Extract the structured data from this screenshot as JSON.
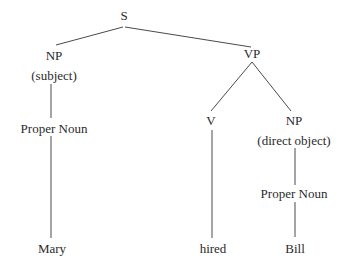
{
  "diagram": {
    "type": "parse-tree",
    "line_color": "#4a4a4a",
    "text_color": "#2a2a2a",
    "nodes": [
      {
        "id": "s",
        "label": "S",
        "x": 124,
        "y": 15
      },
      {
        "id": "np-subj",
        "label": "NP",
        "x": 54,
        "y": 55
      },
      {
        "id": "np-subj-role",
        "label": "(subject)",
        "x": 54,
        "y": 75
      },
      {
        "id": "pn-subj",
        "label": "Proper Noun",
        "x": 54,
        "y": 128
      },
      {
        "id": "mary",
        "label": "Mary",
        "x": 52,
        "y": 248
      },
      {
        "id": "vp",
        "label": "VP",
        "x": 252,
        "y": 53
      },
      {
        "id": "v",
        "label": "V",
        "x": 211,
        "y": 120
      },
      {
        "id": "hired",
        "label": "hired",
        "x": 213,
        "y": 248
      },
      {
        "id": "np-obj",
        "label": "NP",
        "x": 294,
        "y": 120
      },
      {
        "id": "np-obj-role",
        "label": "(direct object)",
        "x": 294,
        "y": 140
      },
      {
        "id": "pn-obj",
        "label": "Proper Noun",
        "x": 294,
        "y": 193
      },
      {
        "id": "bill",
        "label": "Bill",
        "x": 295,
        "y": 248
      }
    ],
    "edges": [
      {
        "from": "s",
        "to": "np-subj",
        "x1": 123,
        "y1": 27,
        "x2": 56,
        "y2": 45
      },
      {
        "from": "s",
        "to": "vp",
        "x1": 125,
        "y1": 27,
        "x2": 251,
        "y2": 47
      },
      {
        "from": "np-subj",
        "to": "pn-subj",
        "x1": 51,
        "y1": 84,
        "x2": 51,
        "y2": 118
      },
      {
        "from": "pn-subj",
        "to": "mary",
        "x1": 51,
        "y1": 136,
        "x2": 51,
        "y2": 238
      },
      {
        "from": "vp",
        "to": "v",
        "x1": 252,
        "y1": 62,
        "x2": 211,
        "y2": 111
      },
      {
        "from": "vp",
        "to": "np-obj",
        "x1": 252,
        "y1": 62,
        "x2": 291,
        "y2": 111
      },
      {
        "from": "v",
        "to": "hired",
        "x1": 212,
        "y1": 130,
        "x2": 212,
        "y2": 238
      },
      {
        "from": "np-obj",
        "to": "pn-obj",
        "x1": 295,
        "y1": 148,
        "x2": 295,
        "y2": 185
      },
      {
        "from": "pn-obj",
        "to": "bill",
        "x1": 295,
        "y1": 202,
        "x2": 295,
        "y2": 237
      }
    ]
  }
}
